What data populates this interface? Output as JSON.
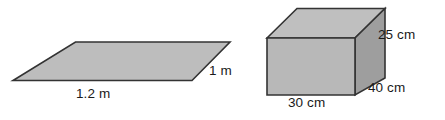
{
  "figures": [
    {
      "id": "flat-rectangle",
      "shape": "parallelogram",
      "name": "rectangular sheet in perspective",
      "fill_color": "#b5b5b5",
      "stroke_color": "#333333",
      "labels": [
        {
          "id": "width",
          "text": "1.2 m",
          "value": 1.2,
          "unit": "m",
          "edge": "front"
        },
        {
          "id": "depth",
          "text": "1 m",
          "value": 1,
          "unit": "m",
          "edge": "right"
        }
      ]
    },
    {
      "id": "cuboid-box",
      "shape": "cuboid",
      "name": "rectangular box in isometric view",
      "fill_front": "#b5b5b5",
      "fill_top": "#bdbdbd",
      "fill_side": "#9a9a9a",
      "stroke_color": "#333333",
      "labels": [
        {
          "id": "height",
          "text": "25 cm",
          "value": 25,
          "unit": "cm",
          "edge": "right-vertical"
        },
        {
          "id": "depth",
          "text": "40 cm",
          "value": 40,
          "unit": "cm",
          "edge": "bottom-right-diagonal"
        },
        {
          "id": "width",
          "text": "30 cm",
          "value": 30,
          "unit": "cm",
          "edge": "bottom-front"
        }
      ]
    }
  ],
  "labels": {
    "rect_width": "1.2 m",
    "rect_depth": "1 m",
    "box_height": "25 cm",
    "box_depth": "40 cm",
    "box_width": "30 cm"
  },
  "colors": {
    "fill_light": "#bdbdbd",
    "fill_front": "#b5b5b5",
    "fill_dark": "#9a9a9a",
    "stroke": "#333333",
    "text": "#1a1a1a",
    "background": "#ffffff"
  }
}
